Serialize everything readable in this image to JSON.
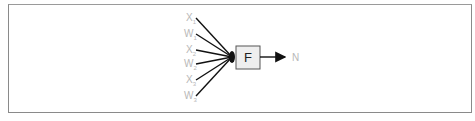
{
  "diagram": {
    "inputs": [
      {
        "symbol": "X",
        "sub": "1"
      },
      {
        "symbol": "W",
        "sub": "1"
      },
      {
        "symbol": "X",
        "sub": "2"
      },
      {
        "symbol": "W",
        "sub": "2"
      },
      {
        "symbol": "X",
        "sub": "3"
      },
      {
        "symbol": "W",
        "sub": "3"
      }
    ],
    "function_box": {
      "label": "F"
    },
    "output": {
      "label": "N"
    },
    "colors": {
      "lines": "#111111",
      "box_fill": "#eeeeee",
      "box_border": "#555555",
      "labels": "#b8b8b8"
    }
  }
}
